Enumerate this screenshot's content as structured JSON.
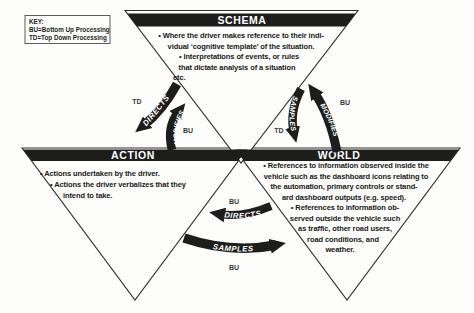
{
  "key": {
    "title": "KEY:",
    "bu_line": "BU=Bottom Up Processing",
    "td_line": "TD=Top Down Processing"
  },
  "schema": {
    "title": "SCHEMA",
    "lines": [
      "•  Where the driver makes reference to their indi-",
      "vidual ‘cognitive template’ of the situation.",
      "•   Interpretations of events, or rules",
      "that dictate analysis of a situation",
      "etc."
    ]
  },
  "action": {
    "title": "ACTION",
    "lines": [
      "•  Actions undertaken by the driver.",
      "•   Actions the driver verbalizes that they",
      "intend to take."
    ]
  },
  "world": {
    "title": "WORLD",
    "lines": [
      "•  References to information observed inside the",
      "vehicle such as the dashboard icons relating to",
      "the automation, primary controls or stand-",
      "ard dashboard outputs (e.g. speed).",
      "•   References to information ob-",
      "served outside the vehicle such",
      "as traffic, other road users,",
      "road conditions, and",
      "weather."
    ]
  },
  "arrows": {
    "directs_left": "DIRECTS",
    "modifies_left": "MODIFIES",
    "samples_right": "SAMPLES",
    "modifies_right": "MODIFIES",
    "directs_bottom": "DIRECTS",
    "samples_bottom": "SAMPLES",
    "td_left": "TD",
    "bu_left": "BU",
    "td_right": "TD",
    "bu_right": "BU",
    "bu_bottom_upper": "BU",
    "bu_bottom_lower": "BU"
  },
  "colors": {
    "ink": "#1d1d1b",
    "bar": "#1d1d1b",
    "background": "#fdfdfc",
    "label_text": "#ffffff"
  }
}
